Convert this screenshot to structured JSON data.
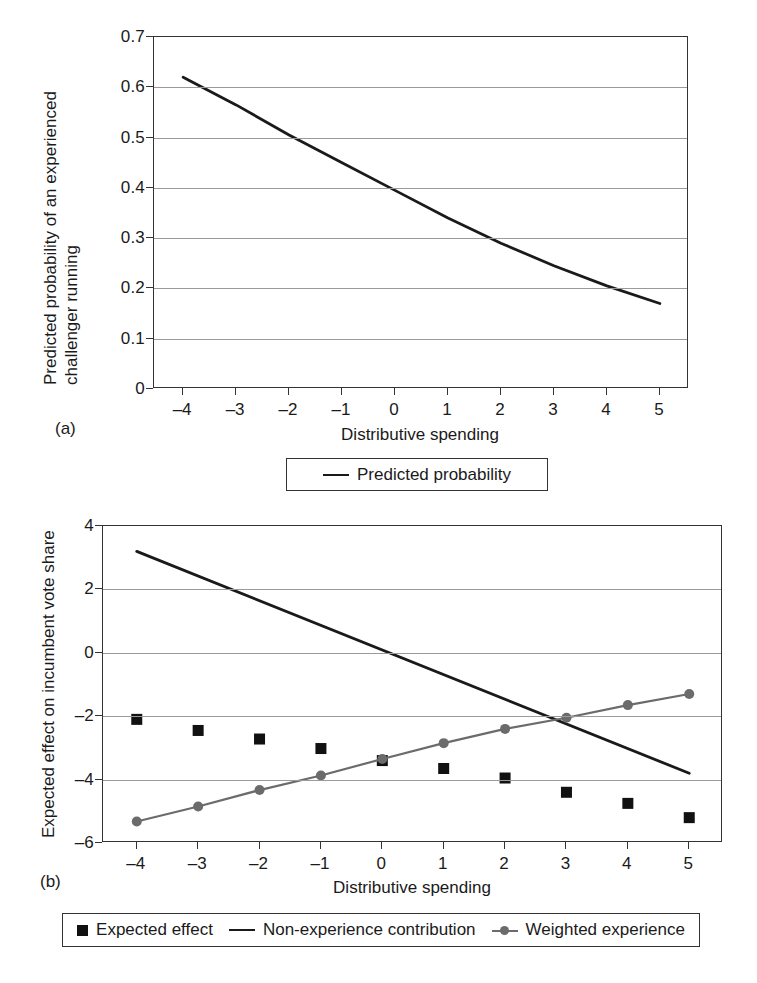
{
  "figure": {
    "panel_a_label": "(a)",
    "panel_b_label": "(b)"
  },
  "chart_data": [
    {
      "id": "panel-a",
      "type": "line",
      "title": "",
      "xlabel": "Distributive spending",
      "ylabel": "Predicted probability of an experienced challenger running",
      "ylabel_line1": "Predicted probability of an experienced",
      "ylabel_line2": "challenger running",
      "xlim": [
        -4.55,
        5.55
      ],
      "ylim": [
        0,
        0.7
      ],
      "xticks": [
        -4,
        -3,
        -2,
        -1,
        0,
        1,
        2,
        3,
        4,
        5
      ],
      "xticklabels": [
        "–4",
        "–3",
        "–2",
        "–1",
        "0",
        "1",
        "2",
        "3",
        "4",
        "5"
      ],
      "yticks": [
        0,
        0.1,
        0.2,
        0.3,
        0.4,
        0.5,
        0.6,
        0.7
      ],
      "yticklabels": [
        "0",
        "0.1",
        "0.2",
        "0.3",
        "0.4",
        "0.5",
        "0.6",
        "0.7"
      ],
      "grid": "horizontal",
      "legend_position": "below",
      "series": [
        {
          "name": "Predicted probability",
          "color": "#1a1a1a",
          "marker": "none",
          "x": [
            -4,
            -3,
            -2,
            -1,
            0,
            1,
            2,
            3,
            4,
            5
          ],
          "values": [
            0.62,
            0.565,
            0.505,
            0.45,
            0.395,
            0.34,
            0.29,
            0.245,
            0.205,
            0.17
          ]
        }
      ],
      "legend": [
        {
          "label": "Predicted probability",
          "key": "line",
          "color": "#1a1a1a"
        }
      ]
    },
    {
      "id": "panel-b",
      "type": "scatter-line",
      "title": "",
      "xlabel": "Distributive spending",
      "ylabel": "Expected effect on incumbent vote share",
      "xlim": [
        -4.55,
        5.55
      ],
      "ylim": [
        -6,
        4
      ],
      "xticks": [
        -4,
        -3,
        -2,
        -1,
        0,
        1,
        2,
        3,
        4,
        5
      ],
      "xticklabels": [
        "–4",
        "–3",
        "–2",
        "–1",
        "0",
        "1",
        "2",
        "3",
        "4",
        "5"
      ],
      "yticks": [
        -6,
        -4,
        -2,
        0,
        2,
        4
      ],
      "yticklabels": [
        "–6",
        "–4",
        "–2",
        "0",
        "2",
        "4"
      ],
      "grid": "horizontal",
      "legend_position": "below",
      "series": [
        {
          "name": "Expected effect",
          "color": "#111111",
          "marker": "square",
          "x": [
            -4,
            -3,
            -2,
            -1,
            0,
            1,
            2,
            3,
            4,
            5
          ],
          "values": [
            -2.1,
            -2.45,
            -2.72,
            -3.02,
            -3.4,
            -3.65,
            -3.95,
            -4.4,
            -4.75,
            -5.2
          ]
        },
        {
          "name": "Non-experience contribution",
          "color": "#1a1a1a",
          "marker": "none",
          "x": [
            -4,
            5
          ],
          "values": [
            3.2,
            -3.8
          ]
        },
        {
          "name": "Weighted experience",
          "color": "#6b6b6b",
          "marker": "circle",
          "x": [
            -4,
            -3,
            -2,
            -1,
            0,
            1,
            2,
            3,
            4,
            5
          ],
          "values": [
            -5.32,
            -4.85,
            -4.33,
            -3.87,
            -3.35,
            -2.85,
            -2.4,
            -2.05,
            -1.65,
            -1.3
          ]
        }
      ],
      "legend": [
        {
          "label": "Expected effect",
          "key": "square",
          "color": "#111111"
        },
        {
          "label": "Non-experience contribution",
          "key": "line",
          "color": "#1a1a1a"
        },
        {
          "label": "Weighted experience",
          "key": "marker-line",
          "color": "#6b6b6b"
        }
      ]
    }
  ]
}
